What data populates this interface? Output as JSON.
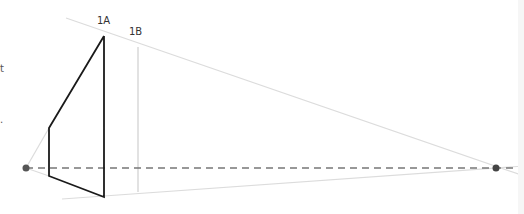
{
  "diagram": {
    "type": "two-point perspective construction",
    "labels": {
      "line_1a": "1A",
      "line_1b": "1B"
    },
    "edge_fragments": {
      "fragment_1": "t",
      "fragment_2": "."
    },
    "colors": {
      "object_stroke": "#1a1a1a",
      "guide_stroke": "#d9d9d9",
      "horizon_stroke": "#777777",
      "vanishing_point": "#555555"
    },
    "vanishing_points": {
      "left": {
        "x": 26,
        "y": 168
      },
      "right": {
        "x": 496,
        "y": 168
      }
    },
    "horizon_y": 168
  }
}
